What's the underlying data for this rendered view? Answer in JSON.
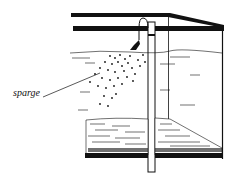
{
  "figure": {
    "type": "illustration",
    "labels": {
      "sparge": "sparge"
    },
    "colors": {
      "ink": "#111111",
      "background": "#ffffff"
    }
  }
}
